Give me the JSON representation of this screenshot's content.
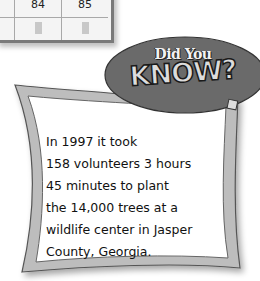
{
  "table_fragment": {
    "columns": [
      {
        "value": "",
        "left": 0,
        "width": 18
      },
      {
        "value": "84",
        "left": 18,
        "width": 46
      },
      {
        "value": "85",
        "left": 64,
        "width": 46
      }
    ]
  },
  "callout": {
    "badge_line1": "Did You",
    "badge_line2": "KNOW?",
    "fact_lines": [
      "In 1997 it took",
      "158 volunteers 3 hours",
      "45 minutes to plant",
      "the 14,000 trees at a",
      "wildlife center in Jasper",
      "County, Georgia."
    ]
  }
}
